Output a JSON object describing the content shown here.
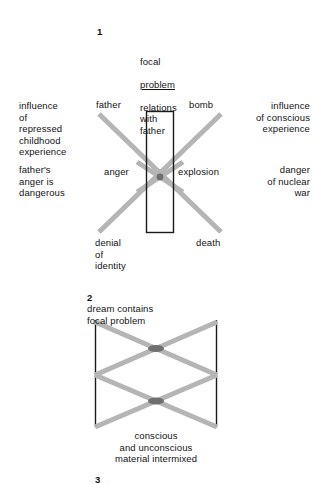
{
  "diagram1": {
    "number": "1",
    "focal_title_line1": "focal",
    "focal_title_underlined": "problem",
    "focal_title_rest": "relations\nwith\nfather",
    "left_upper": "influence\nof\nrepressed\nchildhood\nexperience",
    "left_lower": "father's\nanger is\ndangerous",
    "right_upper": "influence\nof conscious\nexperience",
    "right_lower": "danger\nof nuclear\nwar",
    "node_top_left": "father",
    "node_top_right": "bomb",
    "node_mid_left": "anger",
    "node_mid_right": "explosion",
    "node_bottom_left": "denial\nof\nidentity",
    "node_bottom_right": "death"
  },
  "diagram2": {
    "number": "2",
    "caption_top": "dream contains\nfocal problem",
    "caption_bottom": "conscious\nand unconscious\nmaterial intermixed"
  },
  "diagram3": {
    "number": "3"
  },
  "colors": {
    "line_gray": "#b5b5b5",
    "line_gray_dark": "#6f6f6f",
    "rule_black": "#1a1a1a",
    "text": "#131313",
    "background": "#ffffff"
  }
}
